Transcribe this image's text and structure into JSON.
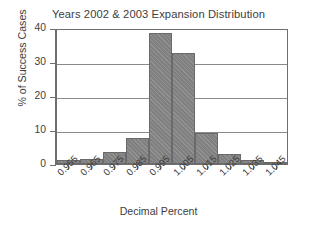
{
  "chart_data": {
    "type": "bar",
    "title": "Years 2002 & 2003 Expansion Distribution",
    "xlabel": "Decimal Percent",
    "ylabel": "% of Success Cases",
    "categories": [
      "0.955",
      "0.965",
      "0.975",
      "0.985",
      "0.995",
      "1.005",
      "1.015",
      "1.025",
      "1.035",
      "1.045"
    ],
    "values": [
      1.1,
      1.5,
      3.5,
      7.7,
      38.5,
      32.6,
      9.2,
      2.8,
      1.3,
      0.6
    ],
    "ylim": [
      0,
      40
    ],
    "yticks": [
      0,
      10,
      20,
      30,
      40
    ],
    "ytick_labels": [
      "0",
      "10",
      "20",
      "30",
      "40"
    ],
    "grid": "horizontal",
    "legend": "none",
    "bar_color": "#808080",
    "bar_edge_color": "#6a6a6a",
    "axis_color": "#6e6e6e",
    "grid_color": "#8a8a8a",
    "background_color": "#ffffff",
    "text_color": "#3d3d3d"
  }
}
